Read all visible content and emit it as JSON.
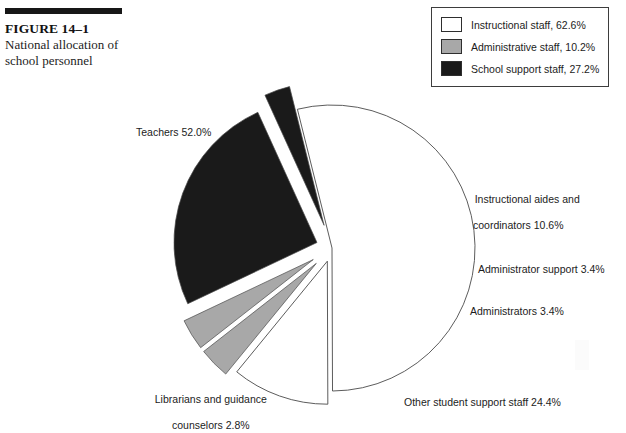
{
  "figure": {
    "number": "FIGURE 14–1",
    "title_line1": "National allocation of",
    "title_line2": "school personnel",
    "rule_color": "#171717"
  },
  "legend": {
    "items": [
      {
        "label": "Instructional staff, 62.6%",
        "swatch": "#ffffff",
        "value": 62.6
      },
      {
        "label": "Administrative staff, 10.2%",
        "swatch": "#a8a8a8",
        "value": 10.2
      },
      {
        "label": "School support staff, 27.2%",
        "swatch": "#1a1a1a",
        "value": 27.2
      }
    ]
  },
  "labels": {
    "teachers": "Teachers 52.0%",
    "aides_line1": "Instructional aides and",
    "aides_line2": "coordinators 10.6%",
    "administrator_support": "Administrator support 3.4%",
    "administrators": "Administrators 3.4%",
    "other_student_support": "Other student support staff 24.4%",
    "librarians_line1": "Librarians and guidance",
    "librarians_line2": "counselors 2.8%"
  },
  "chart_data": {
    "type": "pie",
    "title": "National allocation of school personnel",
    "units": "percent",
    "total": 100.0,
    "center": [
      332,
      248
    ],
    "radius": 143,
    "start_angle_deg": -104,
    "direction": "clockwise",
    "categories": [
      "Teachers",
      "Instructional aides and coordinators",
      "Administrator support",
      "Administrators",
      "Other student support staff",
      "Librarians and guidance counselors"
    ],
    "values": [
      52.0,
      10.6,
      3.4,
      3.4,
      24.4,
      2.8
    ],
    "colors": [
      "#ffffff",
      "#ffffff",
      "#a8a8a8",
      "#a8a8a8",
      "#1a1a1a",
      "#1a1a1a"
    ],
    "explode": [
      0,
      14,
      22,
      22,
      16,
      24
    ],
    "groups": [
      {
        "name": "Instructional staff",
        "value": 62.6,
        "color": "#ffffff",
        "members": [
          "Teachers",
          "Instructional aides and coordinators"
        ]
      },
      {
        "name": "Administrative staff",
        "value": 10.2,
        "color": "#a8a8a8",
        "members": [
          "Administrator support",
          "Administrators"
        ]
      },
      {
        "name": "School support staff",
        "value": 27.2,
        "color": "#1a1a1a",
        "members": [
          "Other student support staff",
          "Librarians and guidance counselors"
        ]
      }
    ],
    "legend_position": "top-right",
    "grid": false,
    "stroke_color": "#4a4a4a"
  }
}
